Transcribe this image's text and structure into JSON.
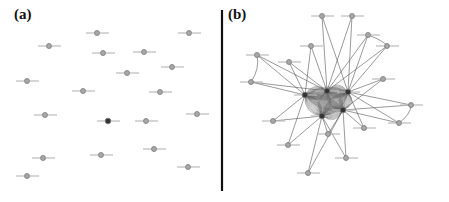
{
  "figure": {
    "panels": [
      {
        "id": "a",
        "label": "(a)"
      },
      {
        "id": "b",
        "label": "(b)"
      }
    ],
    "colors": {
      "node_fill": "#a8a8a8",
      "node_stroke": "#777777",
      "hub_fill": "#333333",
      "edge": "#555555",
      "divider": "#111111",
      "label_blur": "#bbbbbb"
    },
    "panel_a": {
      "description": "isolated nodes, no edges",
      "nodes": [
        {
          "x": 97,
          "y": 33
        },
        {
          "x": 49,
          "y": 46
        },
        {
          "x": 103,
          "y": 53
        },
        {
          "x": 144,
          "y": 52
        },
        {
          "x": 189,
          "y": 33
        },
        {
          "x": 172,
          "y": 67
        },
        {
          "x": 127,
          "y": 73
        },
        {
          "x": 27,
          "y": 81
        },
        {
          "x": 83,
          "y": 91
        },
        {
          "x": 160,
          "y": 92
        },
        {
          "x": 45,
          "y": 115
        },
        {
          "x": 108,
          "y": 121,
          "dark": true
        },
        {
          "x": 146,
          "y": 121
        },
        {
          "x": 197,
          "y": 114
        },
        {
          "x": 43,
          "y": 158
        },
        {
          "x": 101,
          "y": 155
        },
        {
          "x": 154,
          "y": 149
        },
        {
          "x": 188,
          "y": 167
        },
        {
          "x": 27,
          "y": 176
        }
      ]
    },
    "panel_b": {
      "description": "connected network with central hubs",
      "hubs": [
        {
          "x": 327,
          "y": 91
        },
        {
          "x": 348,
          "y": 92
        },
        {
          "x": 322,
          "y": 116
        },
        {
          "x": 343,
          "y": 110
        },
        {
          "x": 305,
          "y": 95
        }
      ],
      "nodes": [
        {
          "x": 322,
          "y": 16
        },
        {
          "x": 352,
          "y": 16
        },
        {
          "x": 368,
          "y": 35
        },
        {
          "x": 387,
          "y": 46
        },
        {
          "x": 311,
          "y": 46
        },
        {
          "x": 289,
          "y": 62
        },
        {
          "x": 257,
          "y": 55
        },
        {
          "x": 251,
          "y": 82
        },
        {
          "x": 383,
          "y": 79
        },
        {
          "x": 411,
          "y": 105
        },
        {
          "x": 399,
          "y": 123
        },
        {
          "x": 273,
          "y": 121
        },
        {
          "x": 364,
          "y": 128
        },
        {
          "x": 328,
          "y": 134
        },
        {
          "x": 288,
          "y": 145
        },
        {
          "x": 346,
          "y": 158
        },
        {
          "x": 308,
          "y": 173
        }
      ]
    }
  }
}
